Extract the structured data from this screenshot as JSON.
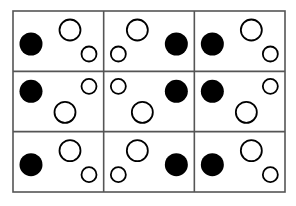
{
  "figure": {
    "canvas": {
      "width": 296,
      "height": 206,
      "background": "#ffffff"
    },
    "grid": {
      "x": 13,
      "y": 11,
      "width": 272,
      "height": 181,
      "rows": 3,
      "cols": 3,
      "cell_width": 90.67,
      "cell_height": 60.33,
      "border_color": "#555555",
      "border_width": 1.6,
      "divider_color": "#555555",
      "divider_width": 1.6,
      "fill": "#ffffff"
    },
    "styles": {
      "filled_color": "#000000",
      "hollow_fill": "#ffffff",
      "hollow_stroke": "#000000",
      "hollow_stroke_width": 1.8
    },
    "cells": [
      {
        "id": "cell-r1c1",
        "row": 1,
        "col": 1,
        "orientation": "left-facing",
        "dots": [
          {
            "name": "large-filled-dot",
            "type": "filled",
            "cx": 18,
            "cy": 33,
            "r": 11.5
          },
          {
            "name": "large-hollow-dot",
            "type": "hollow",
            "cx": 57,
            "cy": 19,
            "r": 10.5
          },
          {
            "name": "small-hollow-dot",
            "type": "hollow",
            "cx": 76,
            "cy": 43,
            "r": 7.5
          }
        ]
      },
      {
        "id": "cell-r1c2",
        "row": 1,
        "col": 2,
        "orientation": "right-facing",
        "dots": [
          {
            "name": "large-filled-dot",
            "type": "filled",
            "cx": 72.67,
            "cy": 33,
            "r": 11.5
          },
          {
            "name": "large-hollow-dot",
            "type": "hollow",
            "cx": 33.67,
            "cy": 19,
            "r": 10.5
          },
          {
            "name": "small-hollow-dot",
            "type": "hollow",
            "cx": 14.67,
            "cy": 43,
            "r": 7.5
          }
        ]
      },
      {
        "id": "cell-r1c3",
        "row": 1,
        "col": 3,
        "orientation": "left-facing",
        "dots": [
          {
            "name": "large-filled-dot",
            "type": "filled",
            "cx": 18,
            "cy": 33,
            "r": 11.5
          },
          {
            "name": "large-hollow-dot",
            "type": "hollow",
            "cx": 57,
            "cy": 19,
            "r": 10.5
          },
          {
            "name": "small-hollow-dot",
            "type": "hollow",
            "cx": 76,
            "cy": 43,
            "r": 7.5
          }
        ]
      },
      {
        "id": "cell-r2c1",
        "row": 2,
        "col": 1,
        "orientation": "left-facing",
        "dots": [
          {
            "name": "large-filled-dot",
            "type": "filled",
            "cx": 18,
            "cy": 20,
            "r": 11.5
          },
          {
            "name": "small-hollow-dot",
            "type": "hollow",
            "cx": 76,
            "cy": 15,
            "r": 7.5
          },
          {
            "name": "large-hollow-dot",
            "type": "hollow",
            "cx": 52,
            "cy": 41,
            "r": 10.5
          }
        ]
      },
      {
        "id": "cell-r2c2",
        "row": 2,
        "col": 2,
        "orientation": "right-facing",
        "dots": [
          {
            "name": "large-filled-dot",
            "type": "filled",
            "cx": 72.67,
            "cy": 20,
            "r": 11.5
          },
          {
            "name": "small-hollow-dot",
            "type": "hollow",
            "cx": 14.67,
            "cy": 15,
            "r": 7.5
          },
          {
            "name": "large-hollow-dot",
            "type": "hollow",
            "cx": 38.67,
            "cy": 41,
            "r": 10.5
          }
        ]
      },
      {
        "id": "cell-r2c3",
        "row": 2,
        "col": 3,
        "orientation": "left-facing",
        "dots": [
          {
            "name": "large-filled-dot",
            "type": "filled",
            "cx": 18,
            "cy": 20,
            "r": 11.5
          },
          {
            "name": "small-hollow-dot",
            "type": "hollow",
            "cx": 76,
            "cy": 15,
            "r": 7.5
          },
          {
            "name": "large-hollow-dot",
            "type": "hollow",
            "cx": 52,
            "cy": 41,
            "r": 10.5
          }
        ]
      },
      {
        "id": "cell-r3c1",
        "row": 3,
        "col": 1,
        "orientation": "left-facing",
        "dots": [
          {
            "name": "large-filled-dot",
            "type": "filled",
            "cx": 18,
            "cy": 33,
            "r": 11.5
          },
          {
            "name": "large-hollow-dot",
            "type": "hollow",
            "cx": 57,
            "cy": 19,
            "r": 10.5
          },
          {
            "name": "small-hollow-dot",
            "type": "hollow",
            "cx": 76,
            "cy": 43,
            "r": 7.5
          }
        ]
      },
      {
        "id": "cell-r3c2",
        "row": 3,
        "col": 2,
        "orientation": "right-facing",
        "dots": [
          {
            "name": "large-filled-dot",
            "type": "filled",
            "cx": 72.67,
            "cy": 33,
            "r": 11.5
          },
          {
            "name": "large-hollow-dot",
            "type": "hollow",
            "cx": 33.67,
            "cy": 19,
            "r": 10.5
          },
          {
            "name": "small-hollow-dot",
            "type": "hollow",
            "cx": 14.67,
            "cy": 43,
            "r": 7.5
          }
        ]
      },
      {
        "id": "cell-r3c3",
        "row": 3,
        "col": 3,
        "orientation": "left-facing",
        "dots": [
          {
            "name": "large-filled-dot",
            "type": "filled",
            "cx": 18,
            "cy": 33,
            "r": 11.5
          },
          {
            "name": "large-hollow-dot",
            "type": "hollow",
            "cx": 57,
            "cy": 19,
            "r": 10.5
          },
          {
            "name": "small-hollow-dot",
            "type": "hollow",
            "cx": 76,
            "cy": 43,
            "r": 7.5
          }
        ]
      }
    ]
  }
}
